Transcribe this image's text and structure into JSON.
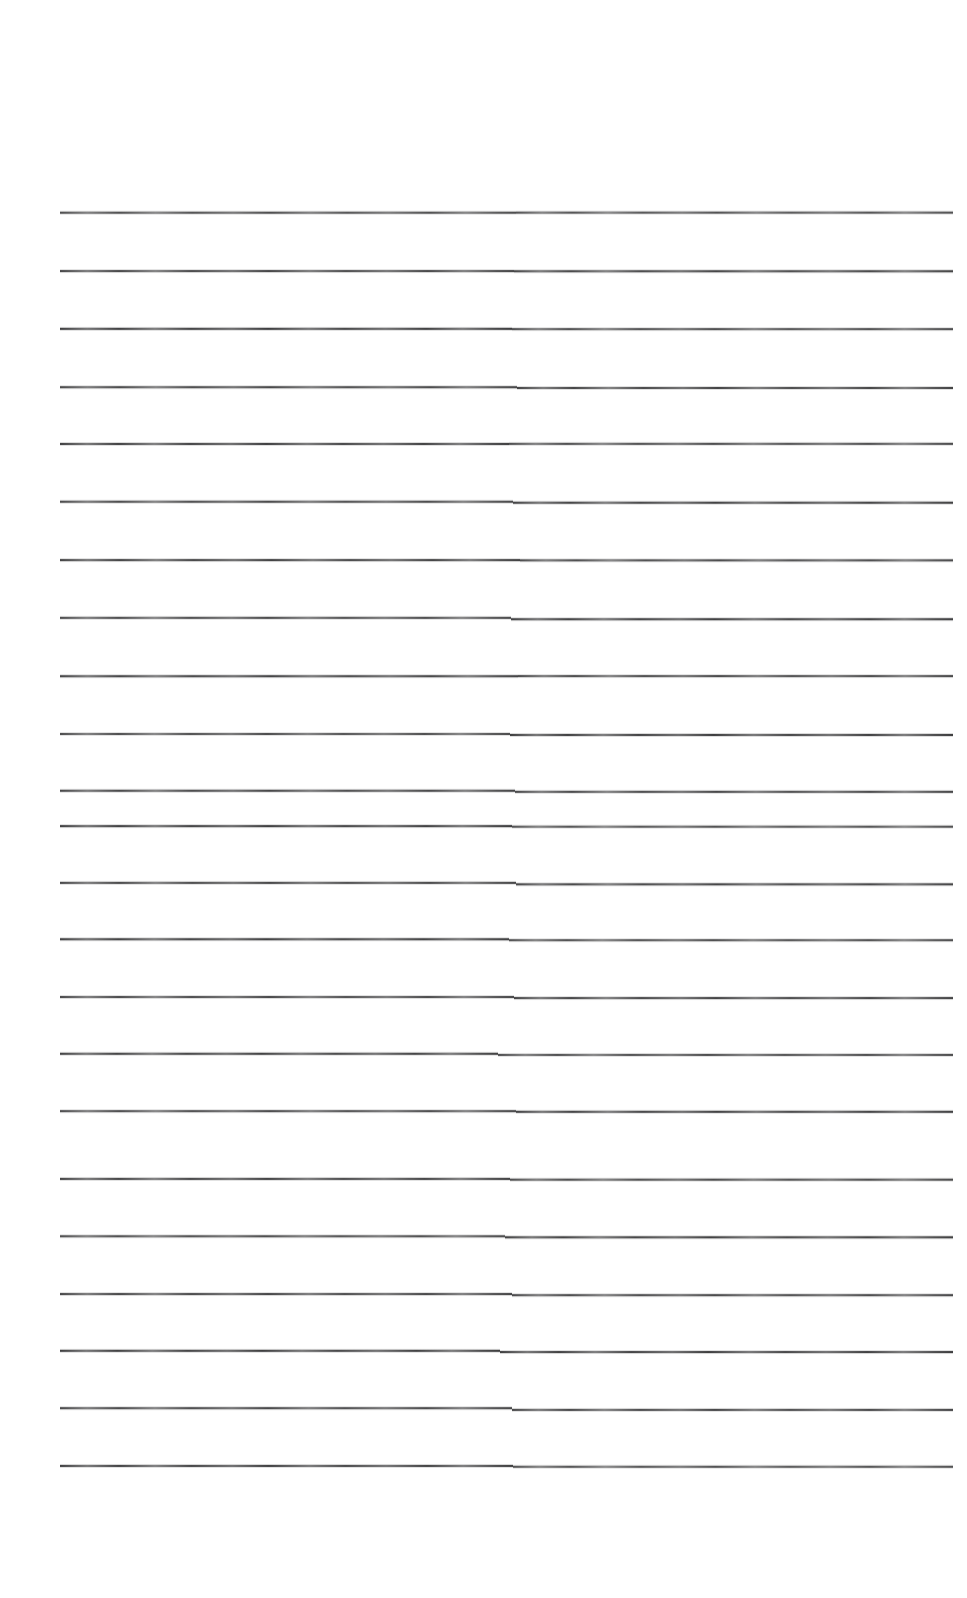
{
  "document": {
    "kind": "scanned-ruled-notebook-page",
    "page_width": 967,
    "page_height": 1598,
    "background_color": "#ffffff",
    "content_text": "",
    "handwriting_present": "none",
    "caption": ""
  },
  "ruling": {
    "line_color": "#3b3b3d",
    "line_thickness_px": 2,
    "line_count": 23,
    "left_margin_px": 60,
    "right_margin_px": 953,
    "first_line_y": 212,
    "last_line_y": 1465,
    "line_spacing_px": 57,
    "stitch_seam_x": 515,
    "top_blank_height_px": 212,
    "bottom_blank_height_px": 133,
    "lines": [
      {
        "y": 212,
        "left_x": 60,
        "right_x": 953,
        "seam_x": 516,
        "jog_px": 0.0
      },
      {
        "y": 270,
        "left_x": 60,
        "right_x": 953,
        "seam_x": 514,
        "jog_px": 0.0
      },
      {
        "y": 328,
        "left_x": 60,
        "right_x": 953,
        "seam_x": 512,
        "jog_px": 0.0
      },
      {
        "y": 386,
        "left_x": 60,
        "right_x": 953,
        "seam_x": 517,
        "jog_px": 0.5
      },
      {
        "y": 443,
        "left_x": 60,
        "right_x": 953,
        "seam_x": 509,
        "jog_px": 0.0
      },
      {
        "y": 501,
        "left_x": 60,
        "right_x": 953,
        "seam_x": 513,
        "jog_px": 0.5
      },
      {
        "y": 559,
        "left_x": 60,
        "right_x": 953,
        "seam_x": 520,
        "jog_px": 0.0
      },
      {
        "y": 617,
        "left_x": 60,
        "right_x": 953,
        "seam_x": 511,
        "jog_px": 0.5
      },
      {
        "y": 675,
        "left_x": 60,
        "right_x": 953,
        "seam_x": 518,
        "jog_px": 0.0
      },
      {
        "y": 733,
        "left_x": 60,
        "right_x": 953,
        "seam_x": 510,
        "jog_px": 0.5
      },
      {
        "y": 790,
        "left_x": 60,
        "right_x": 953,
        "seam_x": 515,
        "jog_px": 1.0
      },
      {
        "y": 825,
        "left_x": 60,
        "right_x": 953,
        "seam_x": 512,
        "jog_px": 1.0
      },
      {
        "y": 882,
        "left_x": 60,
        "right_x": 953,
        "seam_x": 516,
        "jog_px": 1.0
      },
      {
        "y": 938,
        "left_x": 60,
        "right_x": 953,
        "seam_x": 509,
        "jog_px": 0.5
      },
      {
        "y": 996,
        "left_x": 60,
        "right_x": 953,
        "seam_x": 514,
        "jog_px": 1.0
      },
      {
        "y": 1053,
        "left_x": 60,
        "right_x": 953,
        "seam_x": 498,
        "jog_px": 1.0
      },
      {
        "y": 1110,
        "left_x": 60,
        "right_x": 953,
        "seam_x": 516,
        "jog_px": 0.5
      },
      {
        "y": 1178,
        "left_x": 60,
        "right_x": 953,
        "seam_x": 510,
        "jog_px": 1.0
      },
      {
        "y": 1235,
        "left_x": 60,
        "right_x": 953,
        "seam_x": 505,
        "jog_px": 1.0
      },
      {
        "y": 1293,
        "left_x": 60,
        "right_x": 953,
        "seam_x": 512,
        "jog_px": 1.0
      },
      {
        "y": 1350,
        "left_x": 60,
        "right_x": 953,
        "seam_x": 500,
        "jog_px": 1.0
      },
      {
        "y": 1407,
        "left_x": 60,
        "right_x": 953,
        "seam_x": 512,
        "jog_px": 1.5
      },
      {
        "y": 1465,
        "left_x": 60,
        "right_x": 953,
        "seam_x": 513,
        "jog_px": 1.0
      }
    ]
  }
}
